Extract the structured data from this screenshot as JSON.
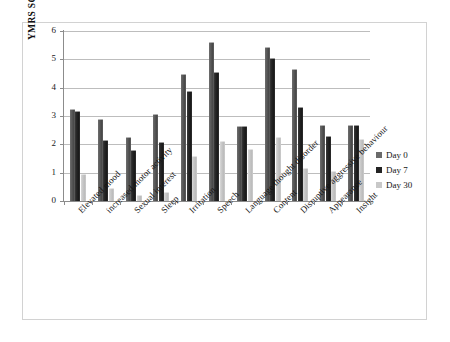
{
  "chart_data": {
    "type": "bar",
    "title": "",
    "xlabel": "",
    "ylabel": "YMRS SCORE",
    "ylim": [
      0,
      6
    ],
    "yticks": [
      0,
      1,
      2,
      3,
      4,
      5,
      6
    ],
    "grid": true,
    "legend_position": "right",
    "categories": [
      "Elevated mood",
      "increased motor activity",
      "Sexual interest",
      "Sleep",
      "Irritation",
      "Speech",
      "Language thought disorder",
      "Content",
      "Disruptive aggressive behaviour",
      "Appearance",
      "Insight"
    ],
    "series": [
      {
        "name": "Day 0",
        "color": "#5a5a5a",
        "values": [
          3.25,
          2.9,
          2.25,
          3.08,
          4.47,
          5.6,
          2.65,
          5.45,
          4.65,
          2.67,
          2.67
        ]
      },
      {
        "name": "Day 7",
        "color": "#232323",
        "values": [
          3.17,
          2.17,
          1.8,
          2.07,
          3.9,
          4.57,
          2.63,
          5.03,
          3.33,
          2.28,
          2.67
        ]
      },
      {
        "name": "Day 30",
        "color": "#c8c8c8",
        "values": [
          0.97,
          0.45,
          0.2,
          0.33,
          1.6,
          2.12,
          1.85,
          2.25,
          1.17,
          1.05,
          2.2
        ]
      }
    ]
  },
  "legend": {
    "items": [
      {
        "label": "Day 0"
      },
      {
        "label": "Day 7"
      },
      {
        "label": "Day 30"
      }
    ]
  }
}
